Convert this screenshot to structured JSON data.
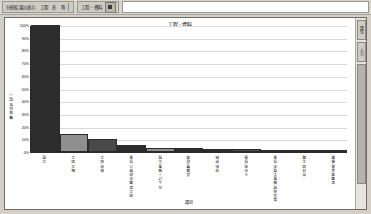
{
  "window": {
    "background_color": "#d4d0c8"
  },
  "toolbar": {
    "groups": [
      {
        "name": "analysis-group",
        "label": "分析結果の表示　工程　名　称",
        "icon": "chart-icon"
      },
      {
        "name": "process-group",
        "label": "工程 - 資料",
        "icon": "grid-icon"
      }
    ],
    "address_value": ""
  },
  "right_tabs": [
    {
      "name": "properties-tab",
      "label": "属性"
    },
    {
      "name": "data-tab",
      "label": "入力"
    }
  ],
  "chart_data": {
    "type": "bar",
    "title": "工程 - 資料",
    "xlabel": "項目",
    "ylabel": "構成比率(％)",
    "ylim": [
      0,
      100
    ],
    "grid": true,
    "legend": "none",
    "ytick_labels": [
      "100%",
      "90%",
      "80%",
      "70%",
      "60%",
      "50%",
      "40%",
      "30%",
      "20%",
      "10%",
      "0%"
    ],
    "categories": [
      "工程",
      "組立加工",
      "部材加工",
      "加工設備の段取り作業",
      "仕上げ・検査工程",
      "品質管理部",
      "材料供給",
      "その他作業",
      "製品出荷検査工程の作業",
      "外注加工費",
      "設備保全業務費"
    ],
    "values": [
      100,
      14,
      10,
      5.5,
      3.5,
      3,
      2.5,
      2,
      1.5,
      1,
      0.8
    ],
    "bar_colors": [
      "#2d2d2d",
      "#8f8f8f",
      "#4a4a4a",
      "#2d2d2d",
      "#8f8f8f",
      "#2d2d2d",
      "#2d2d2d",
      "#4a4a4a",
      "#8f8f8f",
      "#ffffff",
      "#ffffff"
    ]
  }
}
